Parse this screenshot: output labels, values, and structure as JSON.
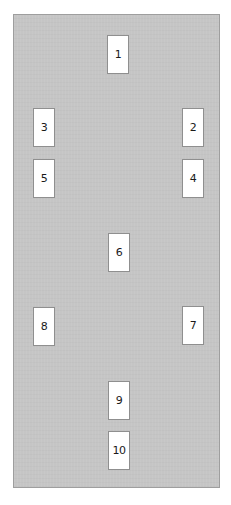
{
  "spread": {
    "background_color": "#c5c5c5",
    "border_color": "#9e9e9e",
    "card_color": "#ffffff",
    "cards": [
      {
        "label": "1",
        "x": 106,
        "y": 34
      },
      {
        "label": "2",
        "x": 181,
        "y": 107
      },
      {
        "label": "3",
        "x": 32,
        "y": 107
      },
      {
        "label": "4",
        "x": 181,
        "y": 158
      },
      {
        "label": "5",
        "x": 32,
        "y": 158
      },
      {
        "label": "6",
        "x": 107,
        "y": 232
      },
      {
        "label": "7",
        "x": 181,
        "y": 305
      },
      {
        "label": "8",
        "x": 32,
        "y": 306
      },
      {
        "label": "9",
        "x": 107,
        "y": 380
      },
      {
        "label": "10",
        "x": 107,
        "y": 430
      }
    ]
  }
}
